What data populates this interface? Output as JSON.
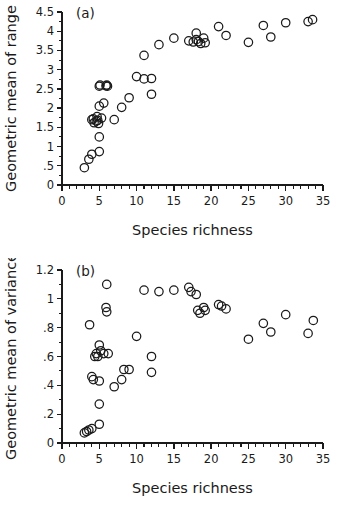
{
  "figure": {
    "name": "two-panel-scatter-figure",
    "background_color": "#ffffff",
    "ink_color": "#1a1a1a"
  },
  "chart_data": [
    {
      "type": "scatter",
      "panel_label": "(a)",
      "title": "",
      "xlabel": "Species richness",
      "ylabel": "Geometric mean of range",
      "xlim": [
        0,
        35
      ],
      "ylim": [
        0,
        4.5
      ],
      "xticks": [
        0,
        5,
        10,
        15,
        20,
        25,
        30,
        35
      ],
      "xtick_labels": [
        "0",
        "5",
        "10",
        "15",
        "20",
        "25",
        "30",
        "35"
      ],
      "xminor_step": 1,
      "yticks": [
        0,
        0.5,
        1,
        1.5,
        2,
        2.5,
        3,
        3.5,
        4,
        4.5
      ],
      "ytick_labels": [
        "0",
        ".5",
        "1",
        "1.5",
        "2",
        "2.5",
        "3",
        "3.5",
        "4",
        "4.5"
      ],
      "yminor_step": 0.1,
      "grid": false,
      "legend": null,
      "marker": "open-circle",
      "marker_size_px": 4.2,
      "x": [
        3,
        3.6,
        4,
        4,
        4.2,
        4.3,
        4.6,
        4.7,
        4.8,
        4.9,
        5,
        5,
        5,
        5,
        5.1,
        5.3,
        5.6,
        5.9,
        6,
        6.1,
        7,
        8,
        9,
        10,
        11,
        11,
        12,
        12,
        13,
        15,
        17,
        17.6,
        18,
        18,
        18.3,
        18.6,
        19,
        19.2,
        21,
        22,
        25,
        27,
        28,
        30,
        33,
        33.6
      ],
      "y": [
        0.45,
        0.67,
        0.8,
        1.7,
        1.72,
        1.62,
        1.66,
        1.78,
        1.68,
        1.6,
        0.87,
        1.25,
        2.05,
        2.57,
        2.6,
        1.74,
        2.13,
        2.58,
        2.6,
        2.57,
        1.7,
        2.02,
        2.27,
        2.82,
        2.76,
        3.37,
        2.36,
        2.77,
        3.65,
        3.82,
        3.75,
        3.72,
        3.95,
        3.78,
        3.73,
        3.68,
        3.82,
        3.7,
        4.12,
        3.89,
        3.71,
        4.15,
        3.85,
        4.22,
        4.25,
        4.3
      ]
    },
    {
      "type": "scatter",
      "panel_label": "(b)",
      "title": "",
      "xlabel": "Species richness",
      "ylabel": "Geometric mean of variance",
      "xlim": [
        0,
        35
      ],
      "ylim": [
        0,
        1.2
      ],
      "xticks": [
        0,
        5,
        10,
        15,
        20,
        25,
        30,
        35
      ],
      "xtick_labels": [
        "0",
        "5",
        "10",
        "15",
        "20",
        "25",
        "30",
        "35"
      ],
      "xminor_step": 1,
      "yticks": [
        0,
        0.2,
        0.4,
        0.6,
        0.8,
        1.0,
        1.2
      ],
      "ytick_labels": [
        "0",
        ".2",
        ".4",
        ".6",
        ".8",
        "1",
        "1.2"
      ],
      "yminor_step": 0.05,
      "grid": false,
      "legend": null,
      "marker": "open-circle",
      "marker_size_px": 4.2,
      "x": [
        3,
        3.3,
        3.6,
        3.7,
        4,
        4,
        4.2,
        4.4,
        4.6,
        4.8,
        5,
        5,
        5,
        5,
        5.2,
        5.6,
        5.9,
        6,
        6,
        6.2,
        7,
        8,
        8.3,
        9,
        10,
        11,
        12,
        12,
        13,
        15,
        17,
        17.3,
        18,
        18.2,
        18.5,
        19,
        19.2,
        21,
        21.4,
        22,
        25,
        27,
        28,
        30,
        33,
        33.7
      ],
      "y": [
        0.07,
        0.08,
        0.09,
        0.82,
        0.1,
        0.46,
        0.44,
        0.6,
        0.62,
        0.6,
        0.13,
        0.27,
        0.43,
        0.68,
        0.64,
        0.62,
        0.94,
        0.91,
        1.1,
        0.62,
        0.39,
        0.44,
        0.51,
        0.51,
        0.74,
        1.06,
        0.49,
        0.6,
        1.05,
        1.06,
        1.08,
        1.05,
        1.03,
        0.92,
        0.9,
        0.94,
        0.92,
        0.96,
        0.95,
        0.93,
        0.72,
        0.83,
        0.77,
        0.89,
        0.76,
        0.85
      ]
    }
  ]
}
